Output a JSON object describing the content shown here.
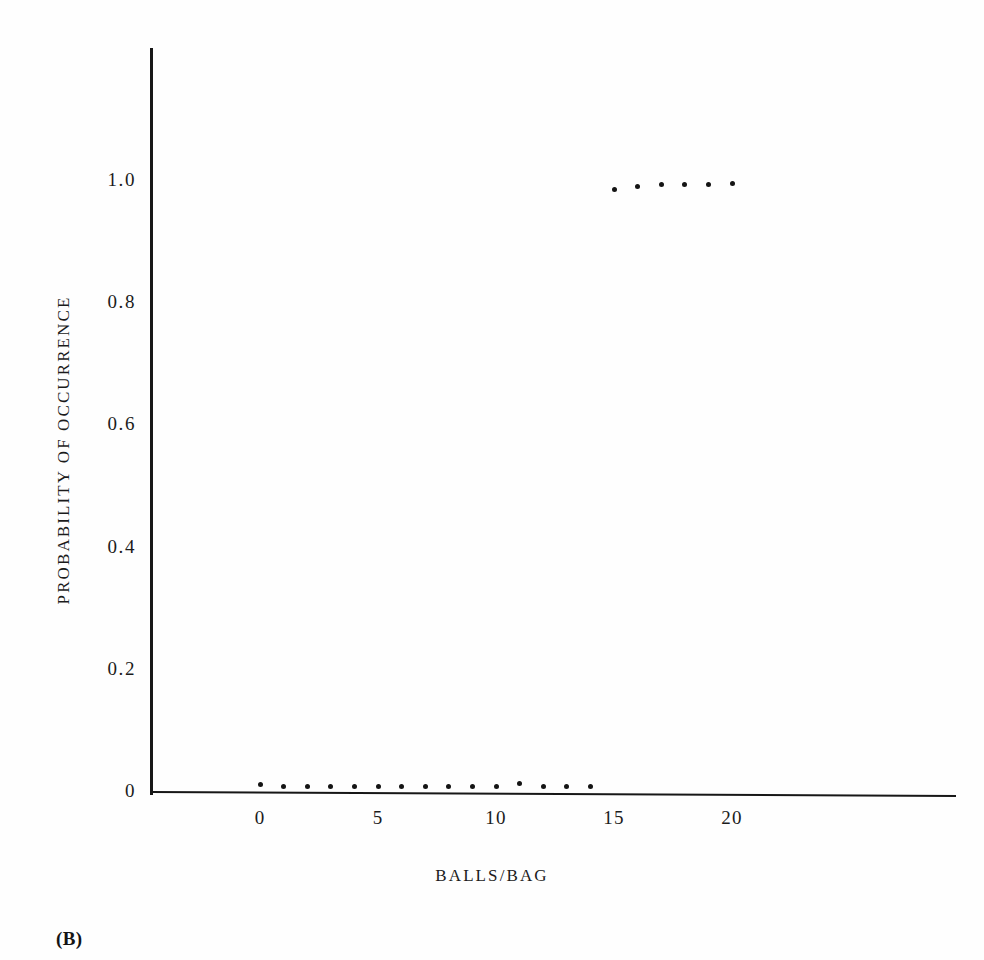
{
  "figure": {
    "panel_label": "(B)",
    "background_color": "#fefefe",
    "ink_color": "#141414"
  },
  "chart_data": {
    "type": "scatter",
    "title": "",
    "xlabel": "BALLS/BAG",
    "ylabel": "PROBABILITY OF OCCURRENCE",
    "xlim": [
      -1.5,
      23
    ],
    "ylim": [
      0,
      1.12
    ],
    "grid": false,
    "legend": null,
    "x_ticks": [
      0,
      5,
      10,
      15,
      20
    ],
    "x_tick_labels": [
      "0",
      "5",
      "10",
      "15",
      "20"
    ],
    "y_ticks": [
      0,
      0.2,
      0.4,
      0.6,
      0.8,
      1.0
    ],
    "y_tick_labels": [
      "0",
      "0.2",
      "0.4",
      "0.6",
      "0.8",
      "1.0"
    ],
    "marker": "dot",
    "series": [
      {
        "name": "low-probability-points",
        "x": [
          0,
          1,
          2,
          3,
          4,
          5,
          6,
          7,
          8,
          9,
          10,
          11,
          12,
          13,
          14
        ],
        "y": [
          0.01,
          0.008,
          0.008,
          0.008,
          0.008,
          0.008,
          0.008,
          0.008,
          0.008,
          0.008,
          0.008,
          0.012,
          0.008,
          0.008,
          0.008
        ]
      },
      {
        "name": "high-probability-points",
        "x": [
          15,
          16,
          17,
          18,
          19,
          20
        ],
        "y": [
          0.985,
          0.99,
          0.992,
          0.992,
          0.992,
          0.995
        ]
      }
    ]
  }
}
